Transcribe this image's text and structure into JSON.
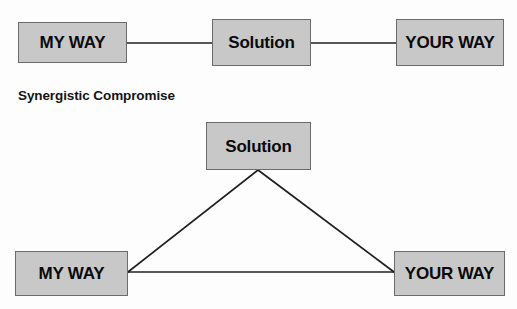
{
  "diagram": {
    "background_color": "#fdfdfd",
    "node_fill_color": "#c8c8c8",
    "node_border_color": "#6b6b6b",
    "edge_color": "#1f1f1f",
    "text_color": "#0a0a0a",
    "caption": "Synergistic Compromise",
    "top_diagram": {
      "layout": "linear",
      "nodes": [
        {
          "id": "top-my-way",
          "label": "MY WAY",
          "x": 18,
          "y": 22,
          "w": 109,
          "h": 41
        },
        {
          "id": "top-solution",
          "label": "Solution",
          "x": 212,
          "y": 19,
          "w": 99,
          "h": 47
        },
        {
          "id": "top-your-way",
          "label": "YOUR WAY",
          "x": 396,
          "y": 19,
          "w": 108,
          "h": 47
        }
      ],
      "edges": [
        {
          "from": "top-my-way",
          "to": "top-solution",
          "x1": 127,
          "y1": 43,
          "x2": 212,
          "y2": 43
        },
        {
          "from": "top-solution",
          "to": "top-your-way",
          "x1": 311,
          "y1": 43,
          "x2": 396,
          "y2": 43
        }
      ]
    },
    "bottom_diagram": {
      "layout": "triangle",
      "nodes": [
        {
          "id": "bot-solution",
          "label": "Solution",
          "x": 206,
          "y": 122,
          "w": 105,
          "h": 48
        },
        {
          "id": "bot-my-way",
          "label": "MY WAY",
          "x": 15,
          "y": 251,
          "w": 113,
          "h": 45
        },
        {
          "id": "bot-your-way",
          "label": "YOUR WAY",
          "x": 394,
          "y": 251,
          "w": 111,
          "h": 45
        }
      ],
      "edges": [
        {
          "from": "bot-my-way",
          "to": "bot-solution",
          "x1": 128,
          "y1": 272,
          "x2": 258,
          "y2": 170
        },
        {
          "from": "bot-solution",
          "to": "bot-your-way",
          "x1": 258,
          "y1": 170,
          "x2": 394,
          "y2": 272
        },
        {
          "from": "bot-my-way",
          "to": "bot-your-way",
          "x1": 128,
          "y1": 272,
          "x2": 394,
          "y2": 272
        }
      ]
    }
  }
}
